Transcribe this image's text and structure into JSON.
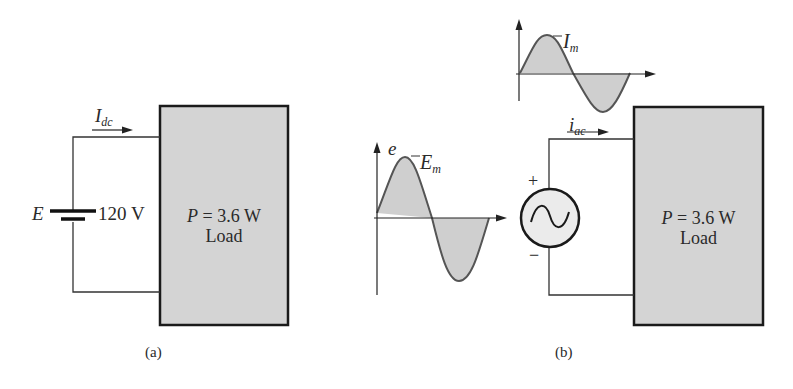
{
  "figure_a": {
    "caption": "(a)",
    "current_label": "I",
    "current_sub": "dc",
    "source_label": "E",
    "source_value": "120 V",
    "load_power_symbol": "P",
    "load_power_eq": "=  3.6 W",
    "load_label": "Load"
  },
  "figure_b": {
    "caption": "(b)",
    "current_label": "i",
    "current_sub": "ac",
    "current_wave_peak": "I",
    "current_wave_peak_sub": "m",
    "voltage_wave_axis": "e",
    "voltage_wave_peak": "E",
    "voltage_wave_peak_sub": "m",
    "plus": "+",
    "minus": "−",
    "load_power_symbol": "P",
    "load_power_eq": "=  3.6 W",
    "load_label": "Load"
  },
  "colors": {
    "load_fill": "#d4d4d4",
    "wave_fill": "#cfcfcf",
    "line": "#222222",
    "wave_stroke": "#555555"
  }
}
